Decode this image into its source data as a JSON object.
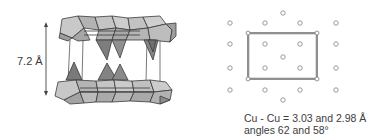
{
  "left_panel": {
    "title": "layered polyhedral structure",
    "interlayer_distance_label": "7.2 Å",
    "colors": {
      "octahedron_light": "#c8c8c8",
      "octahedron_mid": "#a9a9a9",
      "tetrahedron_dark": "#7a7a7a",
      "edge": "#3a3a3a"
    }
  },
  "right_panel": {
    "title": "Cu lattice projection",
    "caption_line1": "Cu - Cu = 3.03 and 2.98 Å",
    "caption_line2": "angles 62 and 58°",
    "colors": {
      "atom": "#9a9a9a",
      "cell": "#555555"
    }
  }
}
